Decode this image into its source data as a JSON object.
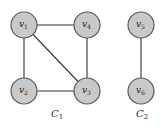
{
  "graph": {
    "nodes": [
      {
        "id": "v1",
        "label": "v",
        "sub": "1",
        "component": "C1"
      },
      {
        "id": "v4",
        "label": "v",
        "sub": "4",
        "component": "C1"
      },
      {
        "id": "v2",
        "label": "v",
        "sub": "2",
        "component": "C1"
      },
      {
        "id": "v3",
        "label": "v",
        "sub": "3",
        "component": "C1"
      },
      {
        "id": "v5",
        "label": "v",
        "sub": "5",
        "component": "C2"
      },
      {
        "id": "v6",
        "label": "v",
        "sub": "6",
        "component": "C2"
      }
    ],
    "edges": [
      [
        "v1",
        "v4"
      ],
      [
        "v1",
        "v2"
      ],
      [
        "v1",
        "v3"
      ],
      [
        "v2",
        "v3"
      ],
      [
        "v4",
        "v3"
      ],
      [
        "v5",
        "v6"
      ]
    ],
    "components": [
      {
        "id": "C1",
        "label": "C",
        "sub": "1"
      },
      {
        "id": "C2",
        "label": "C",
        "sub": "2"
      }
    ],
    "colors": {
      "node_fill": "#c9c9c9",
      "node_stroke": "#5a5a5a",
      "edge": "#333333"
    }
  }
}
